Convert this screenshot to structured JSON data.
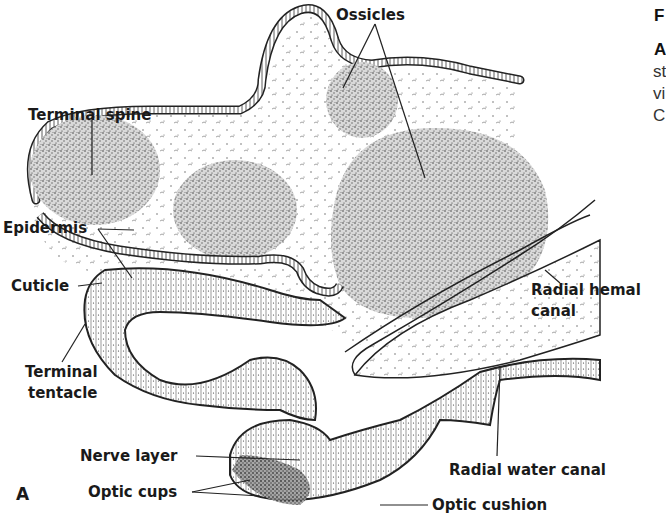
{
  "figure": {
    "panel_letter": "A",
    "labels": {
      "ossicles": "Ossicles",
      "terminal_spine": "Terminal spine",
      "epidermis": "Epidermis",
      "cuticle": "Cuticle",
      "terminal_tentacle_1": "Terminal",
      "terminal_tentacle_2": "tentacle",
      "radial_hemal_canal_1": "Radial hemal",
      "radial_hemal_canal_2": "canal",
      "nerve_layer": "Nerve layer",
      "optic_cups": "Optic cups",
      "radial_water_canal": "Radial water canal",
      "optic_cushion": "Optic cushion"
    },
    "caption_fragments": {
      "line1": "F",
      "line2": "A",
      "line3": "st",
      "line4": "vi",
      "line5": "C"
    }
  }
}
